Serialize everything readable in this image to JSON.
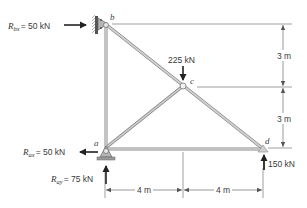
{
  "figure": {
    "type": "truss",
    "nodes": {
      "a": {
        "label": "a"
      },
      "b": {
        "label": "b"
      },
      "c": {
        "label": "c"
      },
      "d": {
        "label": "d"
      }
    },
    "members": [
      "a-b",
      "b-c",
      "c-d",
      "a-c",
      "a-d"
    ],
    "reactions": {
      "Rbx": {
        "symbol": "R",
        "sub": "bx",
        "value": "= 50 kN"
      },
      "Rax": {
        "symbol": "R",
        "sub": "ax",
        "value": "= 50 kN"
      },
      "Ray": {
        "symbol": "R",
        "sub": "ay",
        "value": "= 75 kN"
      }
    },
    "loads": {
      "c_load": "225 kN",
      "d_load": "150 kN"
    },
    "dimensions": {
      "vertical_top": "3 m",
      "vertical_bottom": "3 m",
      "horizontal_left": "4 m",
      "horizontal_right": "4 m"
    },
    "colors": {
      "member": "#b8b8b8",
      "member_edge": "#8a8a8a",
      "text": "#3a3a3a",
      "arrow": "#222222",
      "dim_line": "#555555"
    }
  }
}
